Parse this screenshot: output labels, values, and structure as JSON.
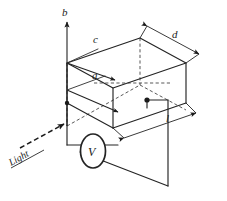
{
  "figure": {
    "background_color": "#ffffff",
    "ink_color": "#242424"
  },
  "axes": [
    {
      "id": "b",
      "label": "b",
      "direction": "up",
      "description": "vertical axis arrow pointing up from front-left corner"
    },
    {
      "id": "c",
      "label": "c",
      "direction": "down-right",
      "description": "axis arrow along the top-rear direction"
    },
    {
      "id": "a",
      "label": "a",
      "direction": "down-right",
      "description": "axis arrow along the depth direction"
    }
  ],
  "dimensions": [
    {
      "id": "d",
      "label": "d",
      "description": "depth of the slab measured along the top-right receding edge"
    },
    {
      "id": "l",
      "label": "l",
      "description": "length of the slab measured along the bottom-front edge"
    }
  ],
  "annotations": {
    "light": {
      "label": "Light",
      "ray_style": "dashed-arrow",
      "direction": "up-right toward slab face"
    },
    "voltmeter": {
      "label": "V",
      "shape": "ellipse",
      "description": "voltmeter in series with the external circuit"
    }
  },
  "terminals": [
    {
      "id": "left-terminal",
      "label": "",
      "description": "contact at front-left corner of slab"
    },
    {
      "id": "right-terminal",
      "label": "",
      "description": "contact dot on the front face of the slab"
    }
  ],
  "colors": {
    "ink": "#242424",
    "hidden_edge": "#3a3a3a",
    "background": "#ffffff"
  }
}
